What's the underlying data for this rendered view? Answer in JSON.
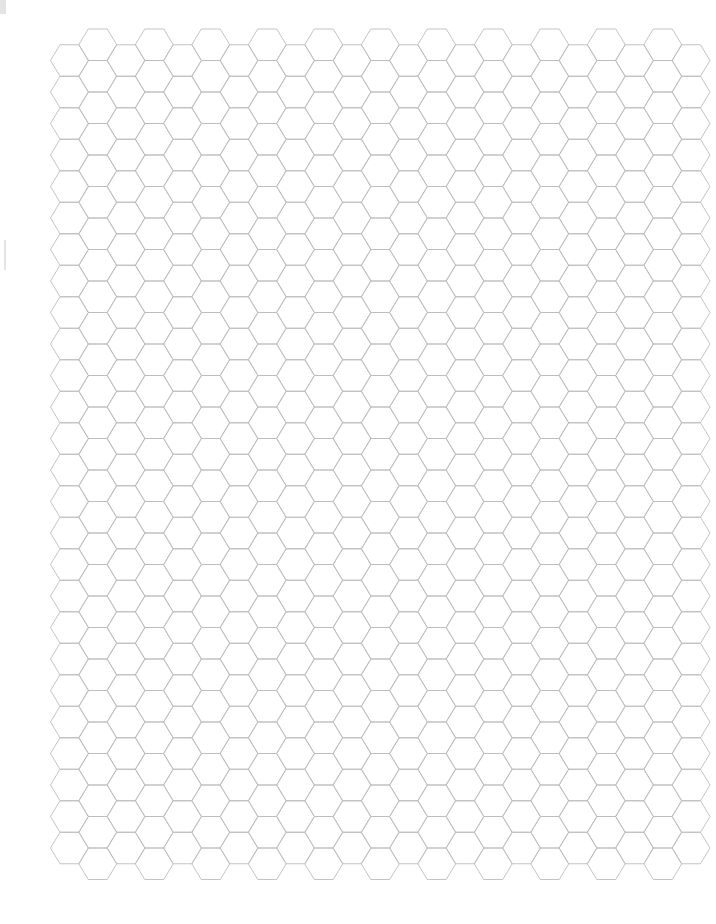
{
  "page": {
    "type": "hexagonal graph paper",
    "background": "#ffffff",
    "line_color": "#bcbcbc",
    "line_width": 0.9
  },
  "grid": {
    "orientation": "flat-top",
    "columns": 23,
    "first_column_center_x": 69.5,
    "column_spacing": 28.25,
    "hex_half_width": 19,
    "hex_half_edge": 9.5,
    "row_height": 31.5,
    "odd_columns": {
      "top_y": 29,
      "hex_count": 27
    },
    "even_columns": {
      "top_y": 44.75,
      "hex_count": 26
    }
  },
  "artifacts": [
    {
      "name": "scan-mark-top-left",
      "x": 0,
      "y": 0,
      "w": 6,
      "h": 14
    },
    {
      "name": "scan-mark-left-edge",
      "x": 4,
      "y": 240,
      "w": 2,
      "h": 30
    }
  ]
}
